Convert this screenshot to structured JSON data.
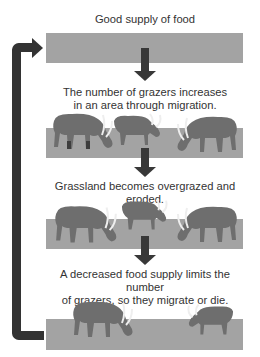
{
  "diagram": {
    "type": "cycle",
    "steps": [
      {
        "id": "step1",
        "text": "Good supply of food",
        "grazers": 0
      },
      {
        "id": "step2",
        "text_lines": [
          "The number of grazers increases",
          "in an area through migration."
        ],
        "grazers": 3
      },
      {
        "id": "step3",
        "text": "Grassland becomes overgrazed and eroded.",
        "grazers": 3
      },
      {
        "id": "step4",
        "text_lines": [
          "A decreased food supply limits the number",
          "of grazers, so they migrate or die."
        ],
        "grazers": 2
      }
    ],
    "loop_arrow": "returns from final stage back to Good supply of food",
    "colors": {
      "grass_bar": "#a3a3a3",
      "arrow": "#383838",
      "loop_arrow": "#333333",
      "grazer_body": "#6e6e6e",
      "grazer_dark": "#3e3e3e"
    }
  }
}
